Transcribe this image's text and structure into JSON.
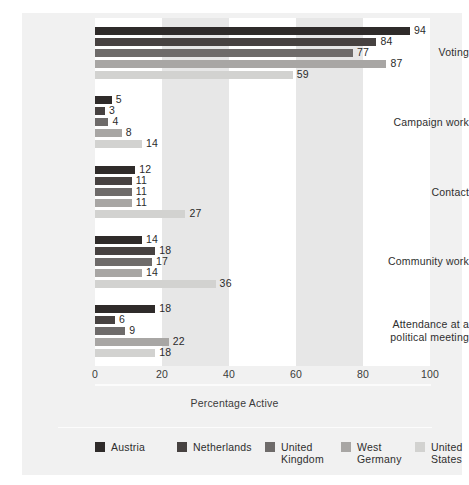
{
  "chart_data": {
    "type": "bar",
    "orientation": "horizontal",
    "title": "",
    "xlabel": "Percentage Active",
    "ylabel": "",
    "xlim": [
      0,
      100
    ],
    "xticks": [
      0,
      20,
      40,
      60,
      80,
      100
    ],
    "grid": false,
    "grid_bands": "alternating vertical bands every 20 units",
    "legend_position": "bottom",
    "categories": [
      "Voting",
      "Campaign work",
      "Contact",
      "Community work",
      "Attendance at a\npolitical meeting"
    ],
    "series": [
      {
        "name": "Austria",
        "color": "#2f2b2a",
        "values": [
          94,
          5,
          12,
          14,
          18
        ]
      },
      {
        "name": "Netherlands",
        "color": "#474241",
        "values": [
          84,
          3,
          11,
          18,
          6
        ]
      },
      {
        "name": "United\nKingdom",
        "color": "#6e6b6a",
        "values": [
          77,
          4,
          11,
          17,
          9
        ]
      },
      {
        "name": "West\nGermany",
        "color": "#a8a6a4",
        "values": [
          87,
          8,
          11,
          14,
          22
        ]
      },
      {
        "name": "United\nStates",
        "color": "#d2d2d0",
        "values": [
          59,
          14,
          27,
          36,
          18
        ]
      }
    ]
  },
  "axis": {
    "ticks": [
      "0",
      "20",
      "40",
      "60",
      "80",
      "100"
    ],
    "title": "Percentage Active"
  },
  "categories": [
    {
      "label": "Voting"
    },
    {
      "label": "Campaign work"
    },
    {
      "label": "Contact"
    },
    {
      "label": "Community work"
    },
    {
      "label": "Attendance at a\npolitical meeting"
    }
  ],
  "legend": [
    {
      "label": "Austria"
    },
    {
      "label": "Netherlands"
    },
    {
      "label": "United\nKingdom"
    },
    {
      "label": "West\nGermany"
    },
    {
      "label": "United\nStates"
    }
  ],
  "values": {
    "voting": [
      "94",
      "84",
      "77",
      "87",
      "59"
    ],
    "campaign": [
      "5",
      "3",
      "4",
      "8",
      "14"
    ],
    "contact": [
      "12",
      "11",
      "11",
      "11",
      "27"
    ],
    "community": [
      "14",
      "18",
      "17",
      "14",
      "36"
    ],
    "attendance": [
      "18",
      "6",
      "9",
      "22",
      "18"
    ]
  }
}
